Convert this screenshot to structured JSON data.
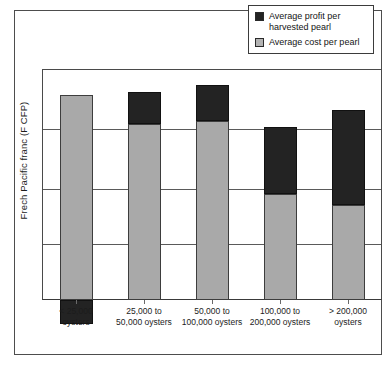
{
  "chart_data": {
    "type": "bar",
    "subtype": "stacked-vertical",
    "title": "",
    "xlabel": "",
    "ylabel": "Frech Pacific franc (F CFP)",
    "categories": [
      "< 25,000 oysters",
      "25,000 to 50,000 oysters",
      "50,000 to 100,000 oysters",
      "100,000 to 200,000 oysters",
      "> 200,000 oysters"
    ],
    "category_lines": [
      [
        "< 25,000",
        "oysters"
      ],
      [
        "25,000 to",
        "50,000 oysters"
      ],
      [
        "50,000 to",
        "100,000 oysters"
      ],
      [
        "100,000 to",
        "200,000 oysters"
      ],
      [
        "> 200,000",
        "oysters"
      ]
    ],
    "series": [
      {
        "name": "Average cost per pearl",
        "color": "#a9a9a9",
        "values": [
          3.73,
          3.2,
          3.25,
          1.93,
          1.72
        ]
      },
      {
        "name": "Average profit per harvested pearl",
        "color": "#232323",
        "values": [
          -0.43,
          0.59,
          0.66,
          1.21,
          1.74
        ]
      }
    ],
    "ylim": [
      -0.6,
      4.0
    ],
    "y_gridlines": [
      1.0,
      2.0,
      3.0,
      4.0
    ],
    "y_tick_labels": [],
    "grid": true,
    "legend_position": "top-right",
    "axis_baseline": 0
  },
  "legend": {
    "entries": [
      {
        "label_lines": [
          "Average profit per",
          "harvested pearl"
        ],
        "swatch": "black-square-swatch"
      },
      {
        "label_lines": [
          "Average cost per pearl"
        ],
        "swatch": "gray-square-swatch"
      }
    ]
  },
  "axis": {
    "y_title": "Frech Pacific franc (F CFP)"
  }
}
